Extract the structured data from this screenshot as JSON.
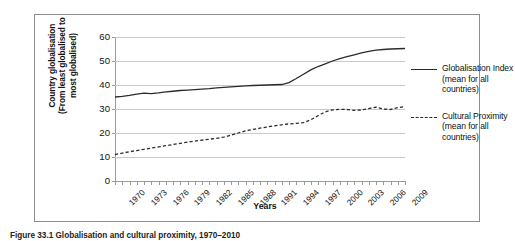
{
  "figure": {
    "caption": "Figure 33.1  Globalisation and cultural proximity, 1970–2010"
  },
  "chart_data": {
    "type": "line",
    "title": "",
    "xlabel": "Years",
    "ylabel": "Country globalisation\n(From least globalised to\nmost globalised)",
    "ylim": [
      0,
      60
    ],
    "yticks": [
      0,
      10,
      20,
      30,
      40,
      50,
      60
    ],
    "xlim": [
      1970,
      2010
    ],
    "xticks": [
      1970,
      1973,
      1976,
      1979,
      1982,
      1985,
      1988,
      1991,
      1994,
      1997,
      2000,
      2003,
      2006,
      2009
    ],
    "xticklabels": [
      "1970",
      "1973",
      "1976",
      "1979",
      "1982",
      "1985",
      "1988",
      "1991",
      "1994",
      "1997",
      "2000",
      "2003",
      "2006",
      "2009"
    ],
    "grid": true,
    "grid_axis": "y",
    "legend_position": "right",
    "x": [
      1970,
      1971,
      1972,
      1973,
      1974,
      1975,
      1976,
      1977,
      1978,
      1979,
      1980,
      1981,
      1982,
      1983,
      1984,
      1985,
      1986,
      1987,
      1988,
      1989,
      1990,
      1991,
      1992,
      1993,
      1994,
      1995,
      1996,
      1997,
      1998,
      1999,
      2000,
      2001,
      2002,
      2003,
      2004,
      2005,
      2006,
      2007,
      2008,
      2009,
      2010
    ],
    "series": [
      {
        "name": "Globalisation Index (mean for all countries)",
        "style": "solid",
        "color": "#2b2b2b",
        "values": [
          35.0,
          35.3,
          35.7,
          36.2,
          36.6,
          36.4,
          36.7,
          37.1,
          37.4,
          37.7,
          37.9,
          38.1,
          38.3,
          38.5,
          38.8,
          39.0,
          39.2,
          39.4,
          39.6,
          39.8,
          39.9,
          40.0,
          40.1,
          40.2,
          41.0,
          42.7,
          44.5,
          46.3,
          47.7,
          48.8,
          50.0,
          51.0,
          51.8,
          52.6,
          53.4,
          54.0,
          54.5,
          54.8,
          55.0,
          55.1,
          55.2
        ]
      },
      {
        "name": "Cultural Proximity (mean for all countries)",
        "style": "dashed",
        "color": "#2b2b2b",
        "values": [
          11.0,
          11.6,
          12.2,
          12.7,
          13.2,
          13.7,
          14.2,
          14.7,
          15.2,
          15.7,
          16.2,
          16.6,
          17.0,
          17.4,
          17.8,
          18.3,
          19.1,
          20.0,
          20.9,
          21.5,
          22.0,
          22.5,
          23.0,
          23.4,
          23.8,
          24.0,
          24.3,
          25.5,
          27.2,
          28.8,
          29.6,
          29.9,
          29.8,
          29.4,
          29.6,
          30.2,
          30.8,
          30.0,
          29.8,
          30.6,
          31.0
        ]
      }
    ]
  }
}
